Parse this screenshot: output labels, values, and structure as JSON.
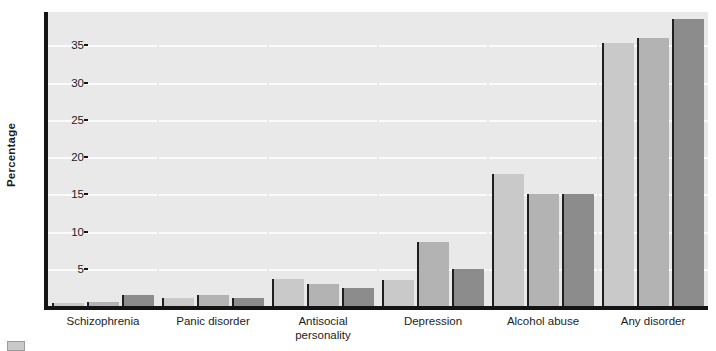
{
  "chart_data": {
    "type": "bar",
    "title": "",
    "xlabel": "",
    "ylabel": "Percentage",
    "ylim": [
      0,
      39.5
    ],
    "yticks": [
      5,
      10,
      15,
      20,
      25,
      30,
      35
    ],
    "ytick_labels": [
      "5",
      "10",
      "15",
      "20",
      "25",
      "30",
      "35"
    ],
    "grid": true,
    "legend_position": "bottom-left",
    "categories": [
      "Schizophrenia",
      "Panic disorder",
      "Antisocial personality",
      "Depression",
      "Alcohol abuse",
      "Any disorder"
    ],
    "category_lines": [
      [
        "Schizophrenia"
      ],
      [
        "Panic disorder"
      ],
      [
        "Antisocial",
        "personality"
      ],
      [
        "Depression"
      ],
      [
        "Alcohol abuse"
      ],
      [
        "Any disorder"
      ]
    ],
    "series": [
      {
        "name": "series-1",
        "color": "#c9c9c9",
        "values": [
          0.3,
          1.1,
          3.6,
          3.5,
          17.8,
          35.3
        ]
      },
      {
        "name": "series-2",
        "color": "#b3b3b3",
        "values": [
          0.6,
          1.5,
          3.0,
          8.6,
          15.1,
          36.0
        ]
      },
      {
        "name": "series-3",
        "color": "#8c8c8c",
        "values": [
          1.5,
          1.1,
          2.4,
          5.0,
          15.0,
          38.5
        ]
      }
    ]
  },
  "colors": {
    "plot_background": "#e9e9e9",
    "gridline": "#fbfbfb",
    "axis": "#141414",
    "bar_light": "#c9c9c9",
    "bar_medium": "#b3b3b3",
    "bar_dark": "#8c8c8c",
    "bar_edge": "#1f1f1f",
    "text": "#1d1d1d"
  },
  "legend": {
    "swatch_color": "#c9c9c9"
  }
}
